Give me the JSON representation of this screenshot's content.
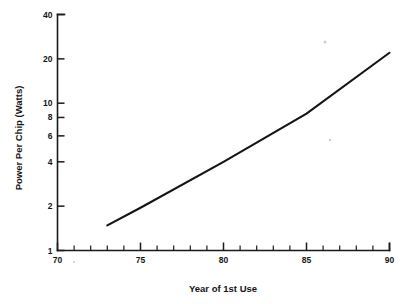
{
  "chart_data": {
    "type": "line",
    "title": "",
    "subtitle": "",
    "xlabel": "Year of 1st Use",
    "ylabel": "Power Per Chip (Watts)",
    "xlim": [
      70,
      90
    ],
    "ylim": [
      1,
      40
    ],
    "yscale": "log",
    "xscale": "linear",
    "grid": false,
    "legend": false,
    "legend_position": "none",
    "x_tick_labels": [
      "70",
      "75",
      "80",
      "85",
      "90"
    ],
    "x_tick_values": [
      70,
      75,
      80,
      85,
      90
    ],
    "x_minor_tick_values": [
      71,
      72,
      73,
      74,
      76,
      77,
      78,
      79,
      81,
      82,
      83,
      84,
      86,
      87,
      88,
      89
    ],
    "y_tick_labels": [
      "1",
      "2",
      "4",
      "6",
      "8",
      "10",
      "20",
      "40"
    ],
    "y_tick_values": [
      1,
      2,
      4,
      6,
      8,
      10,
      20,
      40
    ],
    "series": [
      {
        "name": "Power Per Chip",
        "x": [
          73,
          75,
          80,
          85,
          90
        ],
        "values": [
          1.48,
          1.95,
          4.0,
          8.5,
          22.0
        ]
      }
    ],
    "annotations": []
  },
  "axis_titles": {
    "x": "Year of 1st Use",
    "y": "Power Per Chip (Watts)"
  },
  "colors": {
    "background": "#ffffff",
    "ink": "#141414",
    "axis": "#1a1a1a"
  }
}
